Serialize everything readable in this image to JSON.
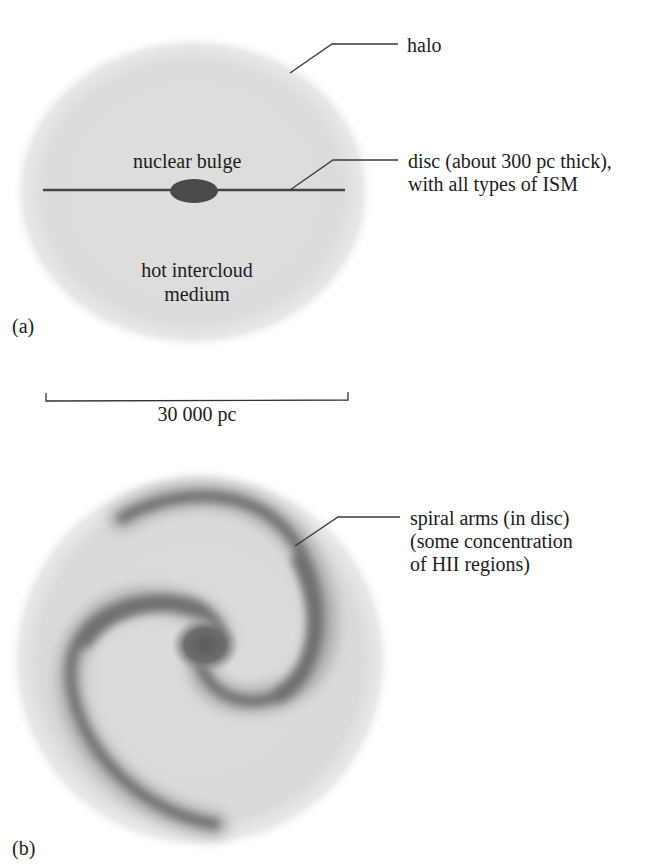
{
  "figure": {
    "panel_a": {
      "label": "(a)",
      "labels": {
        "halo": "halo",
        "nuclear_bulge": "nuclear bulge",
        "disc_line1": "disc (about 300 pc thick),",
        "disc_line2": "with all types of ISM",
        "intercloud_line1": "hot intercloud",
        "intercloud_line2": "medium"
      }
    },
    "scale_bar": {
      "label": "30 000 pc"
    },
    "panel_b": {
      "label": "(b)",
      "labels": {
        "spiral_line1": "spiral arms (in disc)",
        "spiral_line2": "(some concentration",
        "spiral_line3": "of HII regions)"
      }
    },
    "colors": {
      "halo_fill": "#dcdcdc",
      "disc_line": "#444444",
      "bulge": "#4a4a4a",
      "arm": "#6e6e6e",
      "text": "#1c1c1c"
    }
  }
}
